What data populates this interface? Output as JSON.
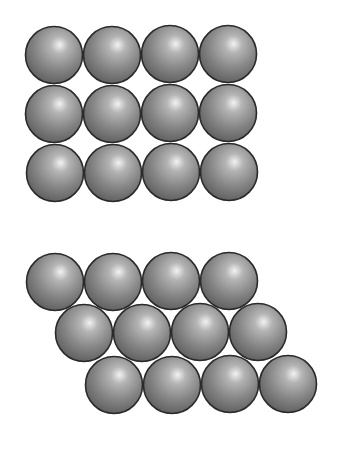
{
  "diagram": {
    "sphere_style": {
      "radius": 28.5,
      "fill_light": "#e8e8e8",
      "fill_mid": "#8a8a8a",
      "fill_dark": "#5e5e5e",
      "stroke": "#2a2a2a",
      "stroke_width": 1.6
    },
    "square_packing": {
      "rows": 3,
      "cols": 4,
      "spheres": [
        {
          "cx": 54,
          "cy": 55
        },
        {
          "cx": 112,
          "cy": 55
        },
        {
          "cx": 170,
          "cy": 54
        },
        {
          "cx": 228,
          "cy": 54
        },
        {
          "cx": 54,
          "cy": 114
        },
        {
          "cx": 112,
          "cy": 114
        },
        {
          "cx": 170,
          "cy": 113
        },
        {
          "cx": 228,
          "cy": 113
        },
        {
          "cx": 55,
          "cy": 173
        },
        {
          "cx": 113,
          "cy": 173
        },
        {
          "cx": 171,
          "cy": 172
        },
        {
          "cx": 229,
          "cy": 172
        }
      ]
    },
    "hexagonal_packing": {
      "rows": 3,
      "cols": 4,
      "spheres": [
        {
          "cx": 55,
          "cy": 282
        },
        {
          "cx": 113,
          "cy": 282
        },
        {
          "cx": 171,
          "cy": 281
        },
        {
          "cx": 229,
          "cy": 281
        },
        {
          "cx": 84,
          "cy": 333
        },
        {
          "cx": 142,
          "cy": 333
        },
        {
          "cx": 200,
          "cy": 332
        },
        {
          "cx": 258,
          "cy": 332
        },
        {
          "cx": 114,
          "cy": 385
        },
        {
          "cx": 172,
          "cy": 385
        },
        {
          "cx": 230,
          "cy": 384
        },
        {
          "cx": 288,
          "cy": 384
        }
      ]
    }
  }
}
